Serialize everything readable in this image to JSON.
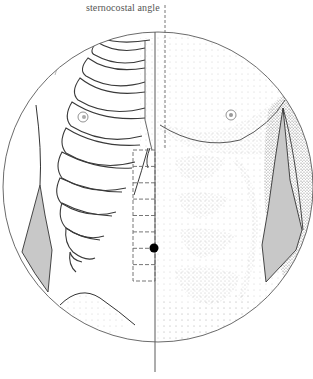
{
  "figure": {
    "labels": {
      "top": "sternocostal angle"
    },
    "colors": {
      "line": "#5a5a5a",
      "rib_stroke": "#3a3a3a",
      "muscle_fill": "#c8c8c8",
      "stipple": "#8a8a8a",
      "dot": "#000000",
      "background": "#ffffff"
    },
    "elements": {
      "circle": {
        "cx": 158,
        "cy": 187,
        "r": 155
      },
      "midline_solid": {
        "x": 155,
        "y1": 32,
        "y2": 372
      },
      "midline_dashed": {
        "x": 165,
        "y1": 5,
        "y2": 150
      },
      "measurement_grid": {
        "x": 133,
        "y": 150,
        "width": 22,
        "height": 131,
        "divisions": 8
      },
      "acupoint_dot": {
        "cx": 154,
        "cy": 248,
        "r": 4.5
      }
    }
  }
}
